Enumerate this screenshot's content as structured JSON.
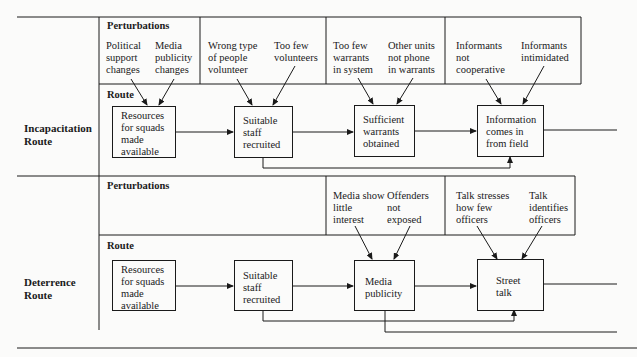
{
  "section_labels": {
    "perturbations": "Perturbations",
    "route": "Route"
  },
  "routes": [
    {
      "name": "Incapacitation\nRoute",
      "perturbations": [
        "Political\nsupport\nchanges",
        "Media\npublicity\nchanges",
        "Wrong type\nof people\nvolunteer",
        "Too few\nvolunteers",
        "Too few\nwarrants\nin system",
        "Other units\nnot phone\nin warrants",
        "Informants\nnot\ncooperative",
        "Informants\nintimidated"
      ],
      "steps": [
        "Resources\nfor squads\nmade\navailable",
        "Suitable\nstaff\nrecruited",
        "Sufficient\nwarrants\nobtained",
        "Information\ncomes in\nfrom field"
      ]
    },
    {
      "name": "Deterrence\nRoute",
      "perturbations": [
        "Media show\nlittle\ninterest",
        "Offenders\nnot\nexposed",
        "Talk stresses\nhow few\nofficers",
        "Talk\nidentifies\nofficers"
      ],
      "steps": [
        "Resources\nfor squads\nmade\navailable",
        "Suitable\nstaff\nrecruited",
        "Media\npublicity",
        "Street\ntalk"
      ]
    }
  ]
}
